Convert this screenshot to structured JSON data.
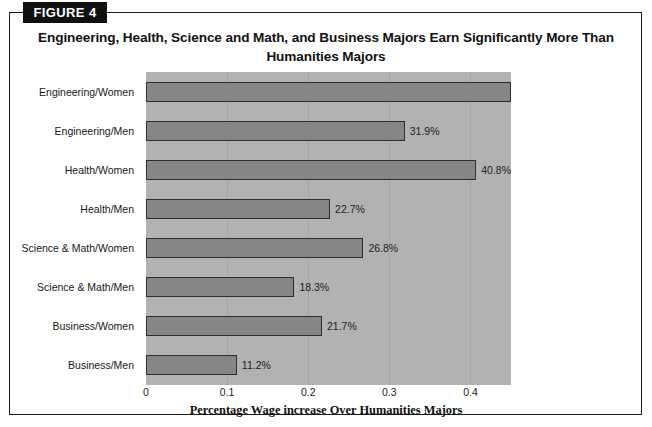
{
  "figure": {
    "badge_label": "FIGURE 4",
    "title": "Engineering, Health, Science and Math, and Business Majors Earn Significantly More Than Humanities Majors"
  },
  "chart_data": {
    "type": "bar",
    "orientation": "horizontal",
    "title": "Engineering, Health, Science and Math, and Business Majors Earn Significantly More Than Humanities Majors",
    "xlabel": "Percentage Wage increase Over Humanities Majors",
    "ylabel": "",
    "xlim": [
      0,
      0.45
    ],
    "xticks": [
      "0",
      "0.1",
      "0.2",
      "0.3",
      "0.4"
    ],
    "xtick_values": [
      0,
      0.1,
      0.2,
      0.3,
      0.4
    ],
    "grid": true,
    "legend": "none",
    "categories": [
      "Engineering/Women",
      "Engineering/Men",
      "Health/Women",
      "Health/Men",
      "Science & Math/Women",
      "Science & Math/Men",
      "Business/Women",
      "Business/Men"
    ],
    "values": [
      0.45,
      0.319,
      0.408,
      0.227,
      0.268,
      0.183,
      0.217,
      0.112
    ],
    "data_labels": [
      "",
      "31.9%",
      "40.8%",
      "22.7%",
      "26.8%",
      "18.3%",
      "21.7%",
      "11.2%"
    ],
    "bars": [
      {
        "category": "Engineering/Women",
        "value": 0.45,
        "label": ""
      },
      {
        "category": "Engineering/Men",
        "value": 0.319,
        "label": "31.9%"
      },
      {
        "category": "Health/Women",
        "value": 0.408,
        "label": "40.8%"
      },
      {
        "category": "Health/Men",
        "value": 0.227,
        "label": "22.7%"
      },
      {
        "category": "Science & Math/Women",
        "value": 0.268,
        "label": "26.8%"
      },
      {
        "category": "Science & Math/Men",
        "value": 0.183,
        "label": "18.3%"
      },
      {
        "category": "Business/Women",
        "value": 0.217,
        "label": "21.7%"
      },
      {
        "category": "Business/Men",
        "value": 0.112,
        "label": "11.2%"
      }
    ],
    "colors": {
      "bar_fill": "#868686",
      "bar_border": "#2e2e2e",
      "plot_background": "#b2b2b2",
      "gridline": "#a5a5a5",
      "frame": "#1a1a1a",
      "badge_background": "#101010",
      "badge_text": "#ffffff"
    }
  }
}
